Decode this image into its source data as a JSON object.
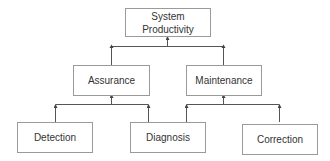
{
  "diagram": {
    "type": "hierarchy",
    "root": {
      "id": "system-productivity",
      "label_line1": "System",
      "label_line2": "Productivity"
    },
    "level2": [
      {
        "id": "assurance",
        "label": "Assurance"
      },
      {
        "id": "maintenance",
        "label": "Maintenance"
      }
    ],
    "level3": [
      {
        "id": "detection",
        "label": "Detection",
        "parent": "assurance"
      },
      {
        "id": "diagnosis",
        "label": "Diagnosis",
        "parent": "assurance,maintenance"
      },
      {
        "id": "correction",
        "label": "Correction",
        "parent": "maintenance"
      }
    ],
    "edges": [
      {
        "from": "assurance",
        "to": "system-productivity"
      },
      {
        "from": "maintenance",
        "to": "system-productivity"
      },
      {
        "from": "detection",
        "to": "assurance"
      },
      {
        "from": "diagnosis",
        "to": "assurance"
      },
      {
        "from": "diagnosis",
        "to": "maintenance"
      },
      {
        "from": "correction",
        "to": "maintenance"
      }
    ],
    "colors": {
      "border": "#9a9a9a",
      "line": "#555555",
      "text": "#333333"
    }
  }
}
